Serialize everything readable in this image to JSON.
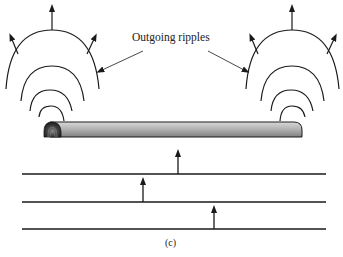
{
  "figure": {
    "annotation": "Outgoing ripples",
    "caption": "(c)",
    "colors": {
      "stroke": "#1a1a1a",
      "rod_light": "#c8c8c8",
      "rod_dark": "#7a7a7a",
      "rod_end": "#2a2a2a",
      "background": "#ffffff"
    },
    "rod": {
      "x1": 44,
      "x2": 302,
      "y_top": 122,
      "y_bottom": 137
    },
    "ripple_groups": [
      {
        "name": "left",
        "center_x": 52,
        "arc_count": 4
      },
      {
        "name": "right",
        "center_x": 292,
        "arc_count": 4
      }
    ],
    "wavefront_lines": [
      {
        "y": 174,
        "arrow_x": 178
      },
      {
        "y": 202,
        "arrow_x": 143
      },
      {
        "y": 229,
        "arrow_x": 214
      }
    ]
  }
}
